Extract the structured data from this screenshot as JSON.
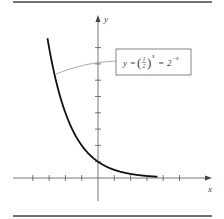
{
  "figure": {
    "function_label": {
      "lhs": "y",
      "eq1": "=",
      "frac_num": "1",
      "frac_den": "2",
      "exp1": "x",
      "eq2": "=",
      "base2": "2",
      "exp2": "−x"
    },
    "axes": {
      "x_label": "x",
      "y_label": "y"
    },
    "colors": {
      "curve": "#111111",
      "axis": "#555555",
      "rule": "#444444",
      "leader": "#888888"
    }
  },
  "chart_data": {
    "type": "line",
    "xlabel": "x",
    "ylabel": "y",
    "xlim": [
      -4,
      7
    ],
    "ylim": [
      -1.5,
      9
    ],
    "x_ticks": [
      -4,
      -3,
      -2,
      -1,
      1,
      2,
      3,
      4,
      5
    ],
    "y_ticks": [
      1,
      2,
      3,
      4,
      5,
      6,
      7,
      8
    ],
    "tick_labels_shown": false,
    "grid": false,
    "series": [
      {
        "name": "y = 2^(-x)",
        "x": [
          -3,
          -2,
          -1,
          0,
          1,
          2,
          3,
          3.7
        ],
        "values": [
          8,
          4,
          2,
          1,
          0.5,
          0.25,
          0.125,
          0.077
        ]
      }
    ]
  }
}
